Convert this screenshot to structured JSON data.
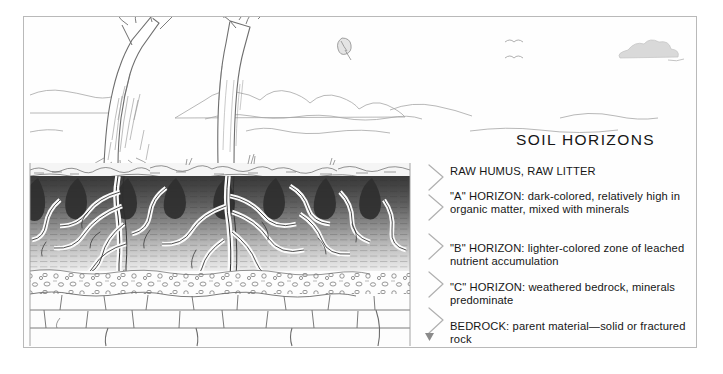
{
  "figure": {
    "title": "SOIL  HORIZONS",
    "labels": {
      "humus": "RAW HUMUS, RAW LITTER",
      "a_horizon": "\"A\" HORIZON: dark-colored, relatively high in organic matter, mixed with minerals",
      "b_horizon": "\"B\" HORIZON: lighter-colored zone of leached nutrient accumulation",
      "c_horizon": "\"C\" HORIZON: weathered bedrock, minerals predominate",
      "bedrock": "BEDROCK: parent material—solid or fractured rock"
    },
    "scene": {
      "sky_elements": [
        "cloud",
        "bird",
        "bird",
        "falling-leaf"
      ],
      "trees": 2,
      "layer_order": [
        "raw humus / raw litter",
        "A horizon",
        "B horizon",
        "C horizon",
        "bedrock"
      ]
    },
    "colors": {
      "border": "#b9b9b9",
      "background": "#fefefe",
      "ink": "#4a4a4a",
      "a_horizon_dark": "#3b3b3b",
      "b_horizon_light": "#d8d8d8",
      "text": "#161616"
    }
  }
}
